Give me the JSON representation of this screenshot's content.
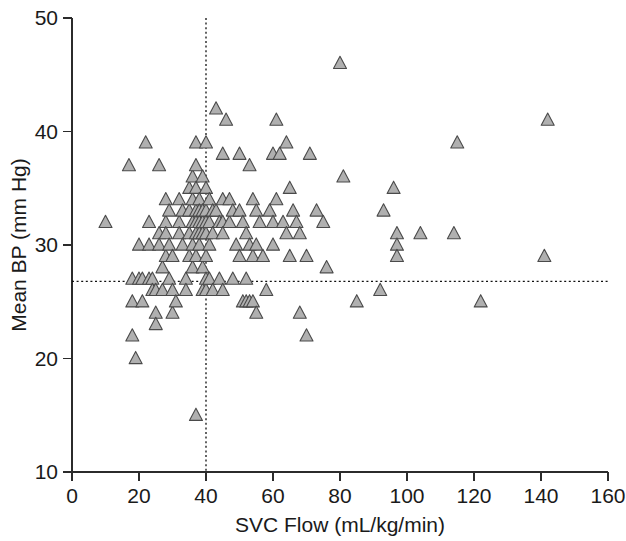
{
  "chart_data": {
    "type": "scatter",
    "title": "",
    "xlabel": "SVC Flow (mL/kg/min)",
    "ylabel": "Mean BP (mm Hg)",
    "xlim": [
      0,
      160
    ],
    "ylim": [
      10,
      50
    ],
    "xticks": [
      0,
      20,
      40,
      60,
      80,
      100,
      120,
      140,
      160
    ],
    "yticks": [
      10,
      20,
      30,
      40,
      50
    ],
    "xticklabels": [
      "0",
      "20",
      "40",
      "60",
      "80",
      "100",
      "120",
      "140",
      "160"
    ],
    "yticklabels": [
      "10",
      "20",
      "30",
      "40",
      "50"
    ],
    "grid": false,
    "legend": null,
    "marker": {
      "shape": "triangle-up",
      "fill_color": "#b0b0b0",
      "edge_color": "#4a4a4a",
      "size_px": 13
    },
    "reference_lines": [
      {
        "name": "vertical-threshold",
        "orientation": "vertical",
        "value": 40,
        "style": "dotted",
        "color": "#111111"
      },
      {
        "name": "horizontal-threshold",
        "orientation": "horizontal",
        "value": 26.8,
        "style": "dotted",
        "color": "#111111"
      }
    ],
    "n_points": 128,
    "points": [
      [
        10,
        32
      ],
      [
        17,
        37
      ],
      [
        18,
        27
      ],
      [
        18,
        25
      ],
      [
        18,
        22
      ],
      [
        19,
        20
      ],
      [
        20,
        30
      ],
      [
        20,
        27
      ],
      [
        21,
        27
      ],
      [
        21,
        25
      ],
      [
        22,
        39
      ],
      [
        23,
        32
      ],
      [
        23,
        30
      ],
      [
        23,
        27
      ],
      [
        24,
        27
      ],
      [
        24,
        26
      ],
      [
        25,
        26
      ],
      [
        25,
        24
      ],
      [
        25,
        23
      ],
      [
        26,
        37
      ],
      [
        26,
        31
      ],
      [
        26,
        30
      ],
      [
        27,
        28
      ],
      [
        27,
        26
      ],
      [
        28,
        34
      ],
      [
        28,
        32
      ],
      [
        28,
        31
      ],
      [
        28,
        29
      ],
      [
        29,
        33
      ],
      [
        29,
        30
      ],
      [
        29,
        27
      ],
      [
        30,
        29
      ],
      [
        30,
        26
      ],
      [
        30,
        24
      ],
      [
        31,
        25
      ],
      [
        32,
        34
      ],
      [
        32,
        32
      ],
      [
        32,
        31
      ],
      [
        33,
        33
      ],
      [
        33,
        30
      ],
      [
        34,
        27
      ],
      [
        34,
        26
      ],
      [
        35,
        35
      ],
      [
        35,
        33
      ],
      [
        35,
        31
      ],
      [
        35,
        29
      ],
      [
        36,
        36
      ],
      [
        36,
        34
      ],
      [
        36,
        32
      ],
      [
        36,
        30
      ],
      [
        36,
        28
      ],
      [
        37,
        39
      ],
      [
        37,
        37
      ],
      [
        37,
        35
      ],
      [
        37,
        33
      ],
      [
        37,
        32
      ],
      [
        37,
        31
      ],
      [
        37,
        29
      ],
      [
        37,
        15
      ],
      [
        38,
        34
      ],
      [
        38,
        33
      ],
      [
        38,
        32
      ],
      [
        38,
        31
      ],
      [
        38,
        30
      ],
      [
        39,
        36
      ],
      [
        39,
        33
      ],
      [
        39,
        32
      ],
      [
        39,
        31
      ],
      [
        39,
        28
      ],
      [
        39,
        26
      ],
      [
        40,
        39
      ],
      [
        40,
        35
      ],
      [
        40,
        33
      ],
      [
        40,
        32
      ],
      [
        40,
        31
      ],
      [
        40,
        29
      ],
      [
        40,
        27
      ],
      [
        40,
        26
      ],
      [
        41,
        34
      ],
      [
        41,
        32
      ],
      [
        41,
        30
      ],
      [
        41,
        27
      ],
      [
        42,
        33
      ],
      [
        42,
        31
      ],
      [
        42,
        26
      ],
      [
        43,
        42
      ],
      [
        43,
        33
      ],
      [
        44,
        32
      ],
      [
        44,
        27
      ],
      [
        45,
        38
      ],
      [
        45,
        34
      ],
      [
        45,
        32
      ],
      [
        45,
        31
      ],
      [
        45,
        26
      ],
      [
        46,
        41
      ],
      [
        47,
        34
      ],
      [
        47,
        32
      ],
      [
        48,
        33
      ],
      [
        48,
        27
      ],
      [
        49,
        30
      ],
      [
        50,
        38
      ],
      [
        50,
        33
      ],
      [
        50,
        29
      ],
      [
        51,
        32
      ],
      [
        51,
        25
      ],
      [
        52,
        31
      ],
      [
        52,
        27
      ],
      [
        52,
        25
      ],
      [
        53,
        37
      ],
      [
        53,
        30
      ],
      [
        53,
        25
      ],
      [
        54,
        34
      ],
      [
        54,
        29
      ],
      [
        54,
        25
      ],
      [
        55,
        33
      ],
      [
        55,
        30
      ],
      [
        55,
        24
      ],
      [
        56,
        32
      ],
      [
        57,
        29
      ],
      [
        58,
        26
      ],
      [
        59,
        33
      ],
      [
        60,
        38
      ],
      [
        60,
        32
      ],
      [
        60,
        30
      ],
      [
        61,
        41
      ],
      [
        61,
        34
      ],
      [
        62,
        38
      ],
      [
        63,
        32
      ],
      [
        64,
        39
      ],
      [
        64,
        31
      ],
      [
        65,
        35
      ],
      [
        65,
        29
      ],
      [
        66,
        33
      ],
      [
        67,
        32
      ],
      [
        68,
        31
      ],
      [
        68,
        24
      ],
      [
        70,
        29
      ],
      [
        70,
        22
      ],
      [
        71,
        38
      ],
      [
        73,
        33
      ],
      [
        75,
        32
      ],
      [
        76,
        28
      ],
      [
        80,
        46
      ],
      [
        81,
        36
      ],
      [
        85,
        25
      ],
      [
        92,
        26
      ],
      [
        93,
        33
      ],
      [
        96,
        35
      ],
      [
        97,
        31
      ],
      [
        97,
        30
      ],
      [
        97,
        29
      ],
      [
        104,
        31
      ],
      [
        114,
        31
      ],
      [
        115,
        39
      ],
      [
        122,
        25
      ],
      [
        141,
        29
      ],
      [
        142,
        41
      ]
    ]
  }
}
